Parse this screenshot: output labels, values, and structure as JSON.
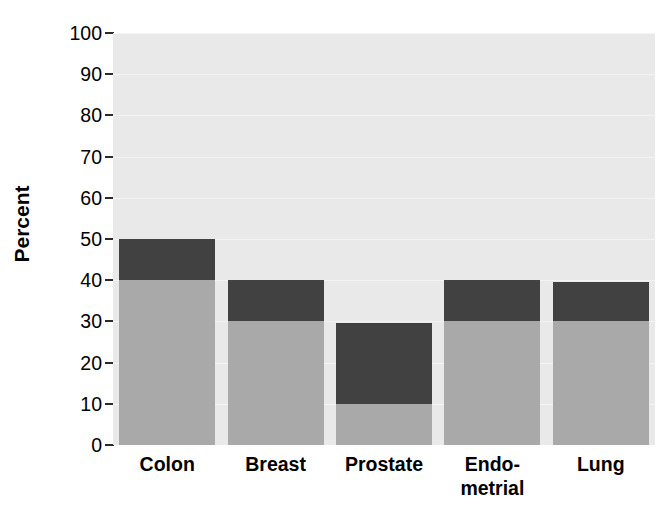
{
  "chart_data": {
    "type": "bar",
    "subtype": "stacked-bar",
    "title": "",
    "subtitle": "",
    "xlabel": "",
    "ylabel": "Percent",
    "categories": [
      "Colon",
      "Breast",
      "Prostate",
      "Endo-metrial",
      "Lung"
    ],
    "category_label_lines": [
      [
        "Colon"
      ],
      [
        "Breast"
      ],
      [
        "Prostate"
      ],
      [
        "Endo-",
        "metrial"
      ],
      [
        "Lung"
      ]
    ],
    "series": [
      {
        "name": "lower-segment",
        "color": "#a9a9a9",
        "values": [
          40,
          30,
          10,
          30,
          30
        ]
      },
      {
        "name": "upper-segment",
        "color": "#414141",
        "values": [
          10,
          10,
          19.5,
          10,
          9.5
        ]
      }
    ],
    "totals": [
      50,
      40,
      29.5,
      40,
      39.5
    ],
    "ylim": [
      0,
      100
    ],
    "ytick_labels": [
      "100",
      "90",
      "80",
      "70",
      "60",
      "50",
      "40",
      "30",
      "20",
      "10",
      "0"
    ],
    "ytick_values": [
      100,
      90,
      80,
      70,
      60,
      50,
      40,
      30,
      20,
      10,
      0
    ],
    "grid": true,
    "grid_axis": "y",
    "legend": false,
    "legend_position": "none",
    "plot_background": "#e9e9e9",
    "gridline_color": "#f4f4f4",
    "figure_background": "#ffffff"
  },
  "axes": {
    "y_title": "Percent"
  }
}
